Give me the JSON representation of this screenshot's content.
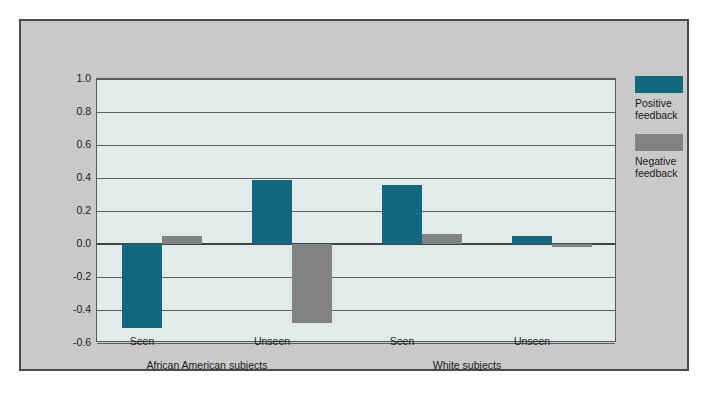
{
  "chart_data": {
    "type": "bar",
    "title": "",
    "subtitle": "",
    "xlabel": "",
    "ylabel": "",
    "ylim": [
      -0.6,
      1.0
    ],
    "ytick_labels": [
      "1.0",
      "0.8",
      "0.6",
      "0.4",
      "0.2",
      "0.0",
      "-0.2",
      "-0.4",
      "-0.6"
    ],
    "ytick_values": [
      1.0,
      0.8,
      0.6,
      0.4,
      0.2,
      0.0,
      -0.2,
      -0.4,
      -0.6
    ],
    "grid": true,
    "legend_position": "right",
    "categories": [
      "Seen",
      "Unseen",
      "Seen",
      "Unseen"
    ],
    "groups": [
      {
        "label": "African American subjects",
        "categories": [
          "Seen",
          "Unseen"
        ]
      },
      {
        "label": "White subjects",
        "categories": [
          "Seen",
          "Unseen"
        ]
      }
    ],
    "series": [
      {
        "name": "Positive feedback",
        "legend_label": "Positive\nfeedback",
        "color": "#12687f",
        "values": [
          -0.51,
          0.39,
          0.36,
          0.05
        ]
      },
      {
        "name": "Negative feedback",
        "legend_label": "Negative\nfeedback",
        "color": "#808284",
        "values": [
          0.05,
          -0.48,
          0.06,
          -0.02
        ]
      }
    ]
  },
  "colors": {
    "positive": "#12687f",
    "negative": "#808284",
    "plot_background": "#e2ebea",
    "panel_background": "#c9c9c9",
    "gridline": "#5a6062",
    "border": "#4a4a4a"
  }
}
